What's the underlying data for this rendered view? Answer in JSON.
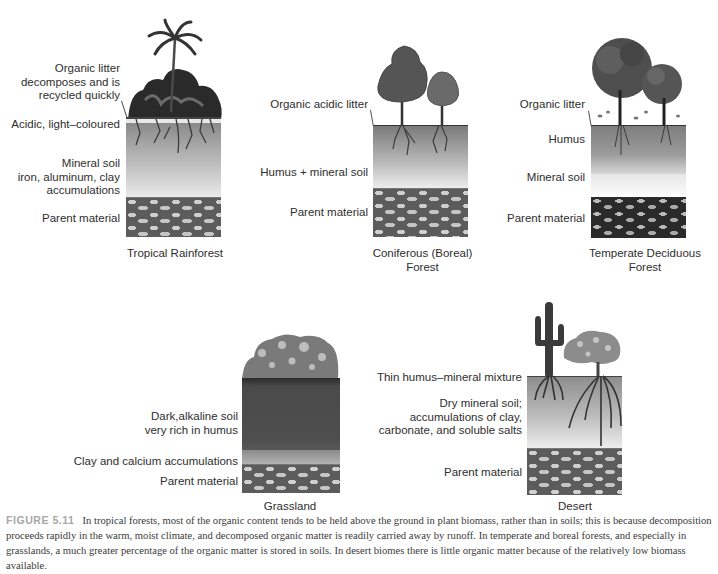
{
  "figure": {
    "label": "FIGURE 5.11",
    "caption": "In tropical forests, most of the organic content tends to be held above the ground in plant biomass, rather than in soils; this is because decomposition proceeds rapidly in the warm, moist climate, and decomposed organic matter is readily carried away by runoff. In temperate and boreal forests, and especially in grasslands, a much greater percentage of the organic matter is stored in soils. In desert biomes there is little organic matter because of the relatively low biomass available."
  },
  "profiles": [
    {
      "title": "Tropical Rainforest",
      "vegetation": "palm-and-dense-rainforest-plants",
      "labels": [
        "Organic litter decomposes and is recycled quickly",
        "Acidic, light–coloured",
        "Mineral soil iron, aluminum, clay accumulations",
        "Parent material"
      ],
      "label_lines": {
        "litter": [
          "Organic litter",
          "decomposes and is",
          "recycled quickly"
        ],
        "acidic": [
          "Acidic, light–coloured"
        ],
        "mineral": [
          "Mineral soil",
          "iron, aluminum, clay",
          "accumulations"
        ],
        "parent": [
          "Parent material"
        ]
      }
    },
    {
      "title": "Coniferous (Boreal) Forest",
      "title_lines": [
        "Coniferous (Boreal)",
        "Forest"
      ],
      "vegetation": "conifer-trees",
      "labels": [
        "Organic acidic litter",
        "Humus + mineral soil",
        "Parent material"
      ]
    },
    {
      "title": "Temperate Deciduous Forest",
      "title_lines": [
        "Temperate Deciduous",
        "Forest"
      ],
      "vegetation": "deciduous-trees",
      "labels": [
        "Organic litter",
        "Humus",
        "Mineral soil",
        "Parent material"
      ]
    },
    {
      "title": "Grassland",
      "vegetation": "grasses-and-flowers",
      "labels": [
        "Dark,alkaline soil very rich in humus",
        "Clay and calcium accumulations",
        "Parent material"
      ],
      "label_lines": {
        "dark": [
          "Dark,alkaline soil",
          "very rich in humus"
        ]
      }
    },
    {
      "title": "Desert",
      "vegetation": "cactus-and-shrub",
      "labels": [
        "Thin humus–mineral mixture",
        "Dry mineral soil; accumulations of clay, carbonate, and soluble salts",
        "Parent material"
      ],
      "label_lines": {
        "dry": [
          "Dry mineral soil;",
          "accumulations of clay,",
          "carbonate, and soluble salts"
        ]
      }
    }
  ]
}
